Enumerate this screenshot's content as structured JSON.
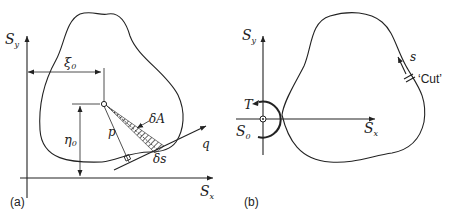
{
  "figure": {
    "panel_a": {
      "caption": "(a)",
      "axis_x_label": "S",
      "axis_x_sub": "x",
      "axis_y_label": "S",
      "axis_y_sub": "y",
      "xi_label": "ξ",
      "xi_sub": "0",
      "eta_label": "η",
      "eta_sub": "0",
      "p_label": "p",
      "q_label": "q",
      "dA_label": "δA",
      "ds_label": "δs"
    },
    "panel_b": {
      "caption": "(b)",
      "axis_x_label": "S",
      "axis_x_sub": "x",
      "axis_y_label": "S",
      "axis_y_sub": "y",
      "origin_label": "S",
      "origin_sub": "0",
      "torque_label": "T",
      "s_label": "s",
      "cut_label": "‘Cut’"
    }
  }
}
